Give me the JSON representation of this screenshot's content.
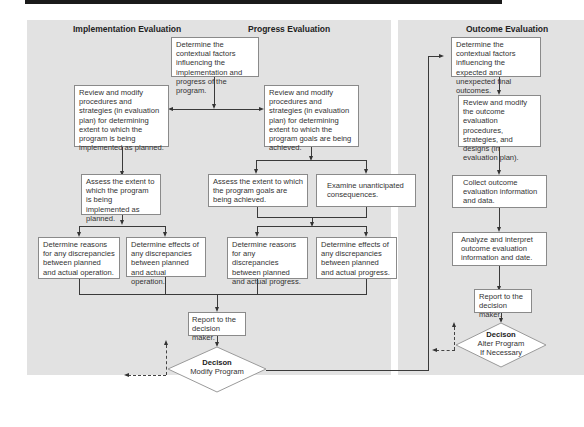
{
  "headings": {
    "implementation": "Implementation Evaluation",
    "progress": "Progress Evaluation",
    "outcome": "Outcome Evaluation"
  },
  "nodes": {
    "context_ip": "Determine the contextual factors influencing the implementation and progress of the program.",
    "review_impl": "Review and modify procedures and strategies (in evaluation plan) for determining extent to which the program is being implemented as planned.",
    "review_prog": "Review and modify procedures and strategies (in evaluation plan) for determining extent to which the program goals are being achieved.",
    "assess_impl": "Assess the extent to which the program is being implemented as planned.",
    "assess_prog": "Assess the extent to which the program goals are being achieved.",
    "examine_unanticipated": "Examine unanticipated consequences.",
    "reasons_operation": "Determine reasons for any discrepancies between planned and actual operation.",
    "effects_operation": "Determine effects of any discrepancies between planned and actual operation.",
    "reasons_progress": "Determine reasons for any discrepancies between planned and actual progress.",
    "effects_progress": "Determine effects of any discrepancies between planned and actual progress.",
    "report_ip": "Report to the decision maker.",
    "decision_ip_title": "Decison",
    "decision_ip_label": "Modify Program",
    "context_outcome": "Determine the contextual factors influencing the expected and unexpected final outcomes.",
    "review_outcome": "Review and modify the outcome evaluation procedures, strategies, and designs (in evaluation plan).",
    "collect_outcome": "Collect outcome evaluation information and data.",
    "analyze_outcome": "Analyze and interpret outcome evaluation information and date.",
    "report_outcome": "Report to the decision maker.",
    "decision_outcome_title": "Decison",
    "decision_outcome_label1": "Alter Program",
    "decision_outcome_label2": "If Necessary"
  }
}
